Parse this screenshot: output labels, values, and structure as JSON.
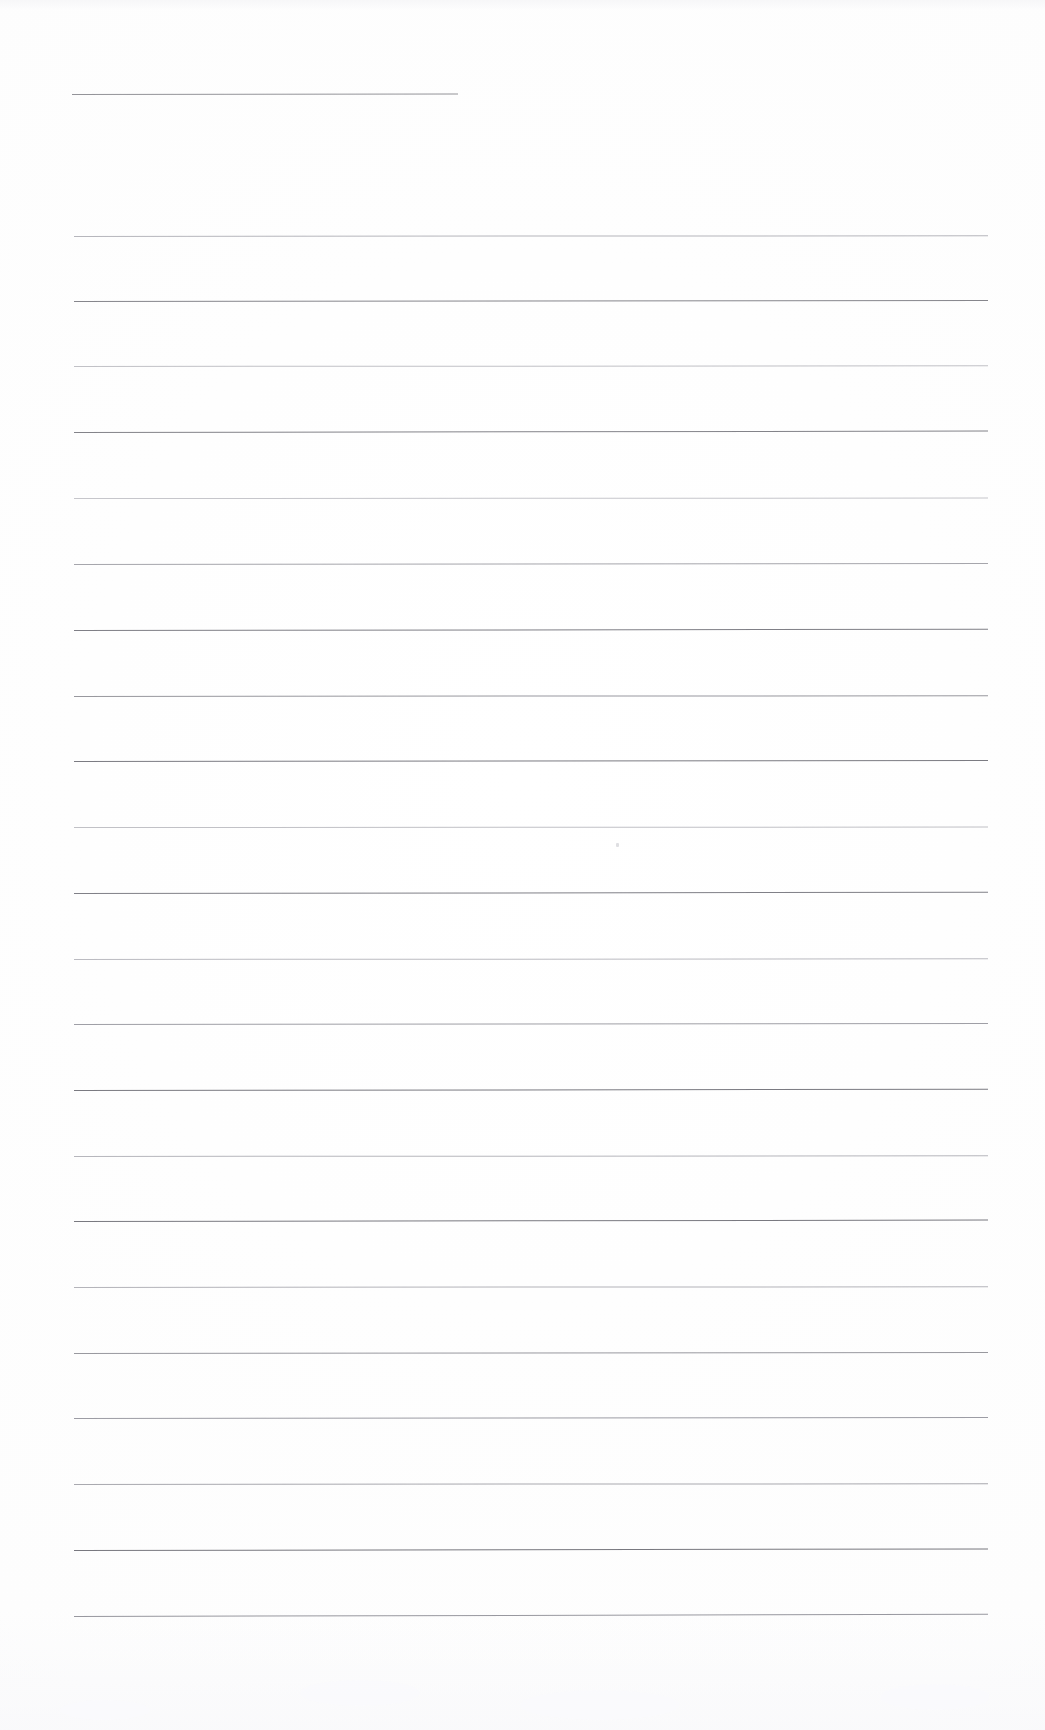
{
  "document": {
    "kind": "scanned-blank-ruled-page",
    "page_title": "Scanned Blank Ruled Notebook Page",
    "page_width": 1045,
    "page_height": 1730,
    "paper_color": "#fefefe",
    "ink_color": "#8a8a90",
    "visible_text": "",
    "notes": "No printed or handwritten text is present; the page shows only horizontal ruled lines."
  },
  "layout": {
    "left_margin": 74,
    "right_margin": 988,
    "content_width": 914,
    "short_rule_right_edge": 458,
    "line_spacing": 66
  },
  "lines": [
    {
      "id": "rule-01",
      "y": 94,
      "x": 72,
      "width": 386,
      "color": "#8e8e94",
      "thickness": 1.1,
      "tilt": -0.06,
      "opacity": 0.95,
      "short": true
    },
    {
      "id": "rule-02",
      "y": 236,
      "x": 74,
      "width": 914,
      "color": "#a9a9b0",
      "thickness": 1.0,
      "tilt": -0.05,
      "opacity": 0.85,
      "short": false
    },
    {
      "id": "rule-03",
      "y": 301,
      "x": 74,
      "width": 914,
      "color": "#7f7f86",
      "thickness": 1.1,
      "tilt": -0.07,
      "opacity": 0.95,
      "short": false
    },
    {
      "id": "rule-04",
      "y": 366,
      "x": 74,
      "width": 914,
      "color": "#b2b2b8",
      "thickness": 1.0,
      "tilt": -0.04,
      "opacity": 0.8,
      "short": false
    },
    {
      "id": "rule-05",
      "y": 432,
      "x": 74,
      "width": 914,
      "color": "#7c7c83",
      "thickness": 1.2,
      "tilt": -0.09,
      "opacity": 0.95,
      "short": false
    },
    {
      "id": "rule-06",
      "y": 498,
      "x": 74,
      "width": 914,
      "color": "#b6b6bc",
      "thickness": 1.0,
      "tilt": -0.03,
      "opacity": 0.78,
      "short": false
    },
    {
      "id": "rule-07",
      "y": 564,
      "x": 74,
      "width": 914,
      "color": "#9a9aa1",
      "thickness": 1.0,
      "tilt": -0.06,
      "opacity": 0.88,
      "short": false
    },
    {
      "id": "rule-08",
      "y": 630,
      "x": 74,
      "width": 914,
      "color": "#7a7a81",
      "thickness": 1.2,
      "tilt": -0.08,
      "opacity": 0.96,
      "short": false
    },
    {
      "id": "rule-09",
      "y": 696,
      "x": 74,
      "width": 914,
      "color": "#8d8d94",
      "thickness": 1.0,
      "tilt": -0.05,
      "opacity": 0.9,
      "short": false
    },
    {
      "id": "rule-10",
      "y": 761,
      "x": 74,
      "width": 914,
      "color": "#77777e",
      "thickness": 1.2,
      "tilt": -0.07,
      "opacity": 0.97,
      "short": false
    },
    {
      "id": "rule-11",
      "y": 827,
      "x": 74,
      "width": 914,
      "color": "#b0b0b6",
      "thickness": 1.0,
      "tilt": -0.03,
      "opacity": 0.78,
      "short": false
    },
    {
      "id": "rule-12",
      "y": 893,
      "x": 74,
      "width": 914,
      "color": "#7b7b82",
      "thickness": 1.2,
      "tilt": -0.08,
      "opacity": 0.96,
      "short": false
    },
    {
      "id": "rule-13",
      "y": 959,
      "x": 74,
      "width": 914,
      "color": "#aaaab1",
      "thickness": 1.0,
      "tilt": -0.04,
      "opacity": 0.8,
      "short": false
    },
    {
      "id": "rule-14",
      "y": 1024,
      "x": 74,
      "width": 914,
      "color": "#92929a",
      "thickness": 1.0,
      "tilt": -0.06,
      "opacity": 0.88,
      "short": false
    },
    {
      "id": "rule-15",
      "y": 1090,
      "x": 74,
      "width": 914,
      "color": "#76767d",
      "thickness": 1.2,
      "tilt": -0.08,
      "opacity": 0.97,
      "short": false
    },
    {
      "id": "rule-16",
      "y": 1156,
      "x": 74,
      "width": 914,
      "color": "#a6a6ad",
      "thickness": 1.0,
      "tilt": -0.04,
      "opacity": 0.82,
      "short": false
    },
    {
      "id": "rule-17",
      "y": 1221,
      "x": 74,
      "width": 914,
      "color": "#75757c",
      "thickness": 1.2,
      "tilt": -0.09,
      "opacity": 0.97,
      "short": false
    },
    {
      "id": "rule-18",
      "y": 1287,
      "x": 74,
      "width": 914,
      "color": "#a4a4ab",
      "thickness": 1.0,
      "tilt": -0.05,
      "opacity": 0.82,
      "short": false
    },
    {
      "id": "rule-19",
      "y": 1353,
      "x": 74,
      "width": 914,
      "color": "#8b8b92",
      "thickness": 1.0,
      "tilt": -0.06,
      "opacity": 0.88,
      "short": false
    },
    {
      "id": "rule-20",
      "y": 1418,
      "x": 74,
      "width": 914,
      "color": "#91919a",
      "thickness": 1.1,
      "tilt": -0.07,
      "opacity": 0.9,
      "short": false
    },
    {
      "id": "rule-21",
      "y": 1484,
      "x": 74,
      "width": 914,
      "color": "#9b9ba2",
      "thickness": 1.0,
      "tilt": -0.05,
      "opacity": 0.86,
      "short": false
    },
    {
      "id": "rule-22",
      "y": 1550,
      "x": 74,
      "width": 914,
      "color": "#74747b",
      "thickness": 1.2,
      "tilt": -0.1,
      "opacity": 0.97,
      "short": false
    },
    {
      "id": "rule-23",
      "y": 1616,
      "x": 74,
      "width": 914,
      "color": "#8f8f97",
      "thickness": 1.1,
      "tilt": -0.14,
      "opacity": 0.92,
      "short": false
    }
  ],
  "artifacts": [
    {
      "id": "speck-01",
      "x": 616,
      "y": 843,
      "label": "scan-speck"
    }
  ],
  "smudges": [
    {
      "id": "smudge-01",
      "x": 300,
      "y": 1680,
      "w": 120,
      "h": 26
    },
    {
      "id": "smudge-02",
      "x": 520,
      "y": 1690,
      "w": 160,
      "h": 30
    },
    {
      "id": "smudge-03",
      "x": 880,
      "y": 1684,
      "w": 110,
      "h": 26
    },
    {
      "id": "smudge-04",
      "x": 60,
      "y": 1700,
      "w": 90,
      "h": 20
    }
  ]
}
